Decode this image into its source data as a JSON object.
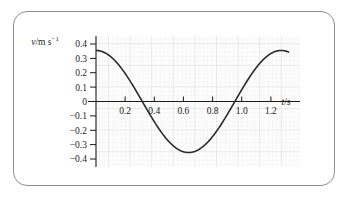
{
  "figure": {
    "border_color": "#8e8e8e",
    "background": "#ffffff"
  },
  "chart_data": {
    "type": "line",
    "title": "",
    "subtitle": "",
    "xlabel": "t/s",
    "ylabel": "v/m s⁻¹",
    "ylabel_symbol": "v",
    "ylabel_unit": "/m s",
    "ylabel_exponent": "−1",
    "xlabel_symbol": "t",
    "xlabel_unit": "/s",
    "xlim": [
      0,
      1.4
    ],
    "ylim": [
      -0.45,
      0.45
    ],
    "xticks": [
      0.2,
      0.4,
      0.6,
      0.8,
      1.0,
      1.2
    ],
    "xtick_labels": [
      "0.2",
      "0.4",
      "0.6",
      "0.8",
      "1.0",
      "1.2"
    ],
    "yticks": [
      0.4,
      0.3,
      0.2,
      0.1,
      0,
      -0.1,
      -0.2,
      -0.3,
      -0.4
    ],
    "ytick_labels": [
      "0.4",
      "0.3",
      "0.2",
      "0.1",
      "0",
      "−0.1",
      "−0.2",
      "−0.3",
      "−0.4"
    ],
    "grid": true,
    "grid_minor_color": "#ededed",
    "grid_major_color": "#dcdcdc",
    "grid_background": "#fcfcfc",
    "legend": null,
    "legend_position": "none",
    "axis_color": "#1a1a1a",
    "curve_color": "#2b2b2b",
    "curve_width": 1.6,
    "series": [
      {
        "name": "velocity",
        "description": "cosine-like oscillation, amplitude 0.355 m/s, period 1.27 s",
        "amplitude": 0.355,
        "period": 1.27,
        "phase_deg": 0,
        "x_start": 0.0,
        "x_end": 1.32,
        "x": [
          0.0,
          0.05,
          0.1,
          0.15,
          0.2,
          0.25,
          0.3,
          0.35,
          0.4,
          0.45,
          0.5,
          0.55,
          0.6,
          0.65,
          0.7,
          0.75,
          0.8,
          0.85,
          0.9,
          0.95,
          1.0,
          1.05,
          1.1,
          1.15,
          1.2,
          1.25,
          1.3,
          1.32
        ],
        "y": [
          0.355,
          0.344,
          0.313,
          0.262,
          0.196,
          0.118,
          0.033,
          -0.054,
          -0.137,
          -0.212,
          -0.276,
          -0.324,
          -0.35,
          -0.355,
          -0.339,
          -0.301,
          -0.244,
          -0.173,
          -0.092,
          -0.006,
          0.08,
          0.161,
          0.232,
          0.289,
          0.329,
          0.351,
          0.354,
          0.35
        ]
      }
    ],
    "annotations": []
  }
}
